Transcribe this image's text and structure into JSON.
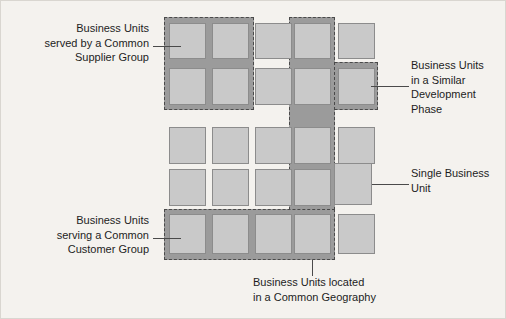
{
  "diagram": {
    "grid": {
      "columns": 5,
      "rows": 5,
      "unit_label": "business-unit-box"
    },
    "colors": {
      "background": "#f4f2ee",
      "unit_fill": "#c9c9c9",
      "unit_border": "#8c8c8c",
      "group_band": "#9b9b9b",
      "group_border": "#4a4a4a",
      "text": "#1d1d1d",
      "leader_line": "#4a4a4a"
    },
    "callouts": [
      {
        "id": "supplier-group",
        "text": "Business Units\nserved by a Common\nSupplier Group",
        "align": "left",
        "covers": "rows 1-2, columns 1-2"
      },
      {
        "id": "development-phase",
        "text": "Business Units\nin a Similar\nDevelopment\nPhase",
        "align": "right",
        "covers": "rows 1-2, columns 4-5"
      },
      {
        "id": "single-business-unit",
        "text": "Single Business\nUnit",
        "align": "right",
        "covers": "row 4, column 5"
      },
      {
        "id": "customer-group",
        "text": "Business Units\nserving a Common\nCustomer Group",
        "align": "left",
        "covers": "row 5, columns 1-4"
      },
      {
        "id": "common-geography",
        "text": "Business Units located\nin a Common Geography",
        "align": "center",
        "covers": "column 4, rows 1-5"
      }
    ],
    "groups": [
      {
        "id": "supplier-group-band",
        "name": "Common Supplier Group"
      },
      {
        "id": "development-phase-band-a",
        "name": "Similar Development Phase"
      },
      {
        "id": "development-phase-band-b",
        "name": "Similar Development Phase"
      },
      {
        "id": "geography-band",
        "name": "Common Geography"
      },
      {
        "id": "customer-group-band",
        "name": "Common Customer Group"
      }
    ]
  }
}
